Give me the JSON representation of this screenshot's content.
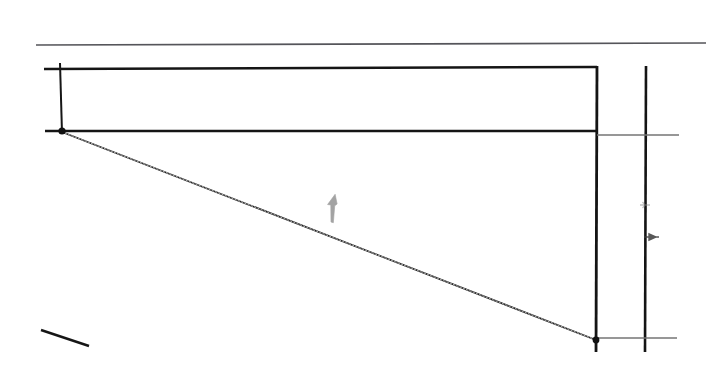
{
  "figure": {
    "title": "FIGURE 3.63",
    "title_color": "#3b3b3b",
    "background_color": "#ffffff",
    "ink_color": "#1a1a1a",
    "light_ink_color": "#6f6f6f",
    "marker_color": "#9b9b9b",
    "width": 721,
    "height": 378
  },
  "elements": {
    "title_rule": {
      "name": "title-underline-rule",
      "x1": 36,
      "y1": 45,
      "x2": 706,
      "y2": 43,
      "color": "#55555a",
      "width": 1.6
    },
    "top_chord": {
      "name": "top-horizontal-member",
      "x1": 44,
      "y1": 69,
      "x2": 597,
      "y2": 67,
      "color": "#151515",
      "width": 2.4
    },
    "mid_chord": {
      "name": "middle-horizontal-member",
      "x1": 45,
      "y1": 131,
      "x2": 597,
      "y2": 131,
      "color": "#151515",
      "width": 2.6
    },
    "left_post": {
      "name": "left-vertical-member",
      "x1": 60,
      "y1": 63,
      "x2": 62,
      "y2": 133,
      "color": "#161616",
      "width": 2.0
    },
    "right_post": {
      "name": "right-vertical-member",
      "x1": 597,
      "y1": 66,
      "x2": 596,
      "y2": 352,
      "color": "#141414",
      "width": 2.8
    },
    "far_right_post": {
      "name": "far-right-vertical-member",
      "x1": 646,
      "y1": 66,
      "x2": 645,
      "y2": 352,
      "color": "#141414",
      "width": 2.6
    },
    "diagonal": {
      "name": "diagonal-deflection-line",
      "x1": 62,
      "y1": 132,
      "x2": 596,
      "y2": 340,
      "color": "#1f1f1f",
      "width": 1.7
    },
    "node_left": {
      "name": "left-node-dot",
      "cx": 62,
      "cy": 131,
      "r": 3.6,
      "color": "#111111"
    },
    "node_right": {
      "name": "right-node-dot",
      "cx": 596,
      "cy": 340,
      "r": 3.4,
      "color": "#111111"
    },
    "upper_tick": {
      "name": "upper-dimension-tick",
      "x1": 597,
      "y1": 135,
      "x2": 679,
      "y2": 135,
      "color": "#747474",
      "width": 1.4
    },
    "lower_tick": {
      "name": "lower-dimension-tick",
      "x1": 596,
      "y1": 338,
      "x2": 677,
      "y2": 338,
      "color": "#747474",
      "width": 1.4
    },
    "dim_arrow_upper": {
      "name": "upper-dimension-arrow-icon",
      "x": 645,
      "y": 205,
      "color": "#8c8c8c"
    },
    "dim_arrow_lower": {
      "name": "lower-dimension-arrow-icon",
      "x": 645,
      "y": 237,
      "color": "#3c3c3c"
    },
    "load_arrow": {
      "name": "load-arrow-marker-icon",
      "x": 331,
      "y": 222,
      "color": "#9a9a9a",
      "length": 28
    },
    "corner_stub": {
      "name": "lower-left-stub-line",
      "x1": 41,
      "y1": 330,
      "x2": 89,
      "y2": 346,
      "color": "#161616",
      "width": 2.4
    }
  }
}
